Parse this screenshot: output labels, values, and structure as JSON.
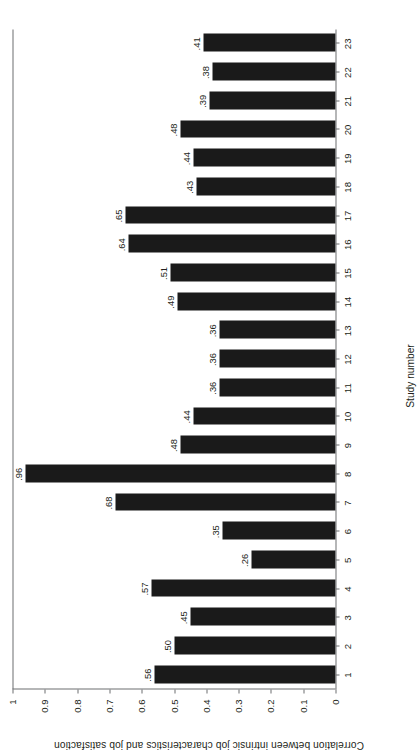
{
  "chart_data": {
    "type": "bar",
    "title": "",
    "orientation": "vertical",
    "xlabel": "Study number",
    "ylabel": "Correlation between intrinsic job characteristics and job satisfaction",
    "categories": [
      "1",
      "2",
      "3",
      "4",
      "5",
      "6",
      "7",
      "8",
      "9",
      "10",
      "11",
      "12",
      "13",
      "14",
      "15",
      "16",
      "17",
      "18",
      "19",
      "20",
      "21",
      "22",
      "23"
    ],
    "values": [
      0.56,
      0.5,
      0.45,
      0.57,
      0.26,
      0.35,
      0.68,
      0.96,
      0.48,
      0.44,
      0.36,
      0.36,
      0.36,
      0.49,
      0.51,
      0.64,
      0.65,
      0.43,
      0.44,
      0.48,
      0.39,
      0.38,
      0.41
    ],
    "data_labels": [
      ".56",
      ".50",
      ".45",
      ".57",
      ".26",
      ".35",
      ".68",
      ".96",
      ".48",
      ".44",
      ".36",
      ".36",
      ".36",
      ".49",
      ".51",
      ".64",
      ".65",
      ".43",
      ".44",
      ".48",
      ".39",
      ".38",
      ".41"
    ],
    "ylim": [
      0,
      1
    ],
    "yticks": [
      0,
      0.1,
      0.2,
      0.3,
      0.4,
      0.5,
      0.6,
      0.7,
      0.8,
      0.9,
      1
    ],
    "ytick_labels": [
      "0",
      "0.1",
      "0.2",
      "0.3",
      "0.4",
      "0.5",
      "0.6",
      "0.7",
      "0.8",
      "0.9",
      "1"
    ],
    "grid": false,
    "legend": null,
    "bar_color": "#1a1a1a",
    "axis_color": "#6d6e71",
    "background": "#ffffff",
    "page_rotation_deg": -90
  }
}
